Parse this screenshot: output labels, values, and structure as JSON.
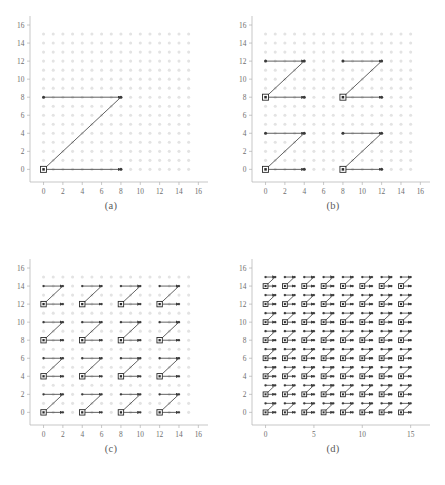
{
  "figure": {
    "title": "",
    "panel_count": 4,
    "layout": "2x2",
    "background_color": "#ffffff",
    "lattice_color": "#e3e3e3",
    "path_color": "#3a3a3a",
    "marker_color": "#2b2b2b",
    "axis_color": "#b0b0b0",
    "tick_label_color": "#6e6e6e"
  },
  "panels": [
    {
      "id": "a",
      "caption": "(a)",
      "xlabel": "",
      "ylabel": "",
      "xticks": [
        0,
        2,
        4,
        6,
        8,
        10,
        12,
        14,
        16
      ],
      "yticks": [
        0,
        2,
        4,
        6,
        8,
        10,
        12,
        14,
        16
      ],
      "xlim": [
        -1.4,
        17.0
      ],
      "ylim": [
        -1.4,
        17.0
      ],
      "lattice": {
        "x_start": 0,
        "x_end": 15,
        "y_start": 0,
        "y_end": 15,
        "step": 1
      },
      "markers": [
        [
          0,
          0
        ]
      ],
      "level": 1,
      "block_size": 8
    },
    {
      "id": "b",
      "caption": "(b)",
      "xlabel": "",
      "ylabel": "",
      "xticks": [
        0,
        2,
        4,
        6,
        8,
        10,
        12,
        14,
        16
      ],
      "yticks": [
        0,
        2,
        4,
        6,
        8,
        10,
        12,
        14,
        16
      ],
      "xlim": [
        -1.4,
        17.0
      ],
      "ylim": [
        -1.4,
        17.0
      ],
      "lattice": {
        "x_start": 0,
        "x_end": 15,
        "y_start": 0,
        "y_end": 15,
        "step": 1
      },
      "markers": [
        [
          0,
          0
        ],
        [
          8,
          0
        ],
        [
          0,
          8
        ],
        [
          8,
          8
        ]
      ],
      "level": 2,
      "block_size": 4
    },
    {
      "id": "c",
      "caption": "(c)",
      "xlabel": "",
      "ylabel": "",
      "xticks": [
        0,
        2,
        4,
        6,
        8,
        10,
        12,
        14,
        16
      ],
      "yticks": [
        0,
        2,
        4,
        6,
        8,
        10,
        12,
        14,
        16
      ],
      "xlim": [
        -1.4,
        17.0
      ],
      "ylim": [
        -1.4,
        17.0
      ],
      "lattice": {
        "x_start": 0,
        "x_end": 15,
        "y_start": 0,
        "y_end": 15,
        "step": 1
      },
      "markers": [
        [
          0,
          0
        ],
        [
          4,
          0
        ],
        [
          8,
          0
        ],
        [
          12,
          0
        ],
        [
          0,
          4
        ],
        [
          4,
          4
        ],
        [
          8,
          4
        ],
        [
          12,
          4
        ],
        [
          0,
          8
        ],
        [
          4,
          8
        ],
        [
          8,
          8
        ],
        [
          12,
          8
        ],
        [
          0,
          12
        ],
        [
          4,
          12
        ],
        [
          8,
          12
        ],
        [
          12,
          12
        ]
      ],
      "level": 3,
      "block_size": 2
    },
    {
      "id": "d",
      "caption": "(d)",
      "xlabel": "",
      "ylabel": "",
      "xticks": [
        0,
        5,
        10,
        15
      ],
      "yticks": [
        0,
        2,
        4,
        6,
        8,
        10,
        12,
        14,
        16
      ],
      "xlim": [
        -1.4,
        17.0
      ],
      "ylim": [
        -1.4,
        17.0
      ],
      "lattice": {
        "x_start": 0,
        "x_end": 15,
        "y_start": 0,
        "y_end": 15,
        "step": 1
      },
      "markers": [
        [
          0,
          0
        ],
        [
          2,
          0
        ],
        [
          4,
          0
        ],
        [
          6,
          0
        ],
        [
          8,
          0
        ],
        [
          10,
          0
        ],
        [
          12,
          0
        ],
        [
          14,
          0
        ],
        [
          0,
          2
        ],
        [
          2,
          2
        ],
        [
          4,
          2
        ],
        [
          6,
          2
        ],
        [
          8,
          2
        ],
        [
          10,
          2
        ],
        [
          12,
          2
        ],
        [
          14,
          2
        ],
        [
          0,
          4
        ],
        [
          2,
          4
        ],
        [
          4,
          4
        ],
        [
          6,
          4
        ],
        [
          8,
          4
        ],
        [
          10,
          4
        ],
        [
          12,
          4
        ],
        [
          14,
          4
        ],
        [
          0,
          6
        ],
        [
          2,
          6
        ],
        [
          4,
          6
        ],
        [
          6,
          6
        ],
        [
          8,
          6
        ],
        [
          10,
          6
        ],
        [
          12,
          6
        ],
        [
          14,
          6
        ],
        [
          0,
          8
        ],
        [
          2,
          8
        ],
        [
          4,
          8
        ],
        [
          6,
          8
        ],
        [
          8,
          8
        ],
        [
          10,
          8
        ],
        [
          12,
          8
        ],
        [
          14,
          8
        ],
        [
          0,
          10
        ],
        [
          2,
          10
        ],
        [
          4,
          10
        ],
        [
          6,
          10
        ],
        [
          8,
          10
        ],
        [
          10,
          10
        ],
        [
          12,
          10
        ],
        [
          14,
          10
        ],
        [
          0,
          12
        ],
        [
          2,
          12
        ],
        [
          4,
          12
        ],
        [
          6,
          12
        ],
        [
          8,
          12
        ],
        [
          10,
          12
        ],
        [
          12,
          12
        ],
        [
          14,
          12
        ],
        [
          0,
          14
        ],
        [
          2,
          14
        ],
        [
          4,
          14
        ],
        [
          6,
          14
        ],
        [
          8,
          14
        ],
        [
          10,
          14
        ],
        [
          12,
          14
        ],
        [
          14,
          14
        ]
      ],
      "level": 4,
      "block_size": 1
    }
  ],
  "chart_data": {
    "type": "scatter",
    "title": "",
    "xlabel": "",
    "ylabel": "",
    "panels": [
      "(a)",
      "(b)",
      "(c)",
      "(d)"
    ],
    "lattice_size": [
      16,
      16
    ],
    "block_sizes": [
      8,
      4,
      2,
      1
    ],
    "anchor_counts": [
      1,
      4,
      16,
      64
    ],
    "xlim": [
      -1.4,
      17.0
    ],
    "ylim": [
      -1.4,
      17.0
    ],
    "grid": false,
    "legend": null,
    "series": [
      {
        "name": "(a) level 1",
        "block_size": 8,
        "anchors": 1,
        "rows_per_block": 2
      },
      {
        "name": "(b) level 2",
        "block_size": 4,
        "anchors": 4,
        "rows_per_block": 2
      },
      {
        "name": "(c) level 3",
        "block_size": 2,
        "anchors": 16,
        "rows_per_block": 2
      },
      {
        "name": "(d) level 4",
        "block_size": 1,
        "anchors": 64,
        "rows_per_block": 2
      }
    ]
  }
}
